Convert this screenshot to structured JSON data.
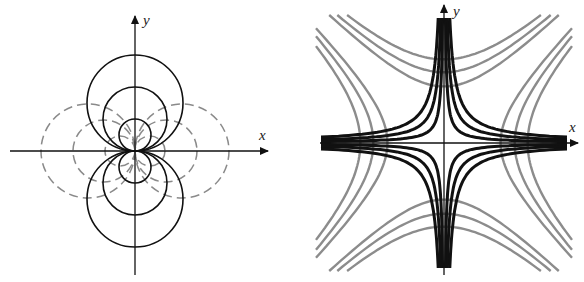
{
  "figure_left": {
    "description": "Dipole field: solid circles tangent to x-axis at origin, dashed circles tangent to y-axis at origin",
    "x_label": "x",
    "y_label": "y",
    "origin": [
      135,
      151
    ],
    "solid_radii": [
      48,
      32,
      16
    ],
    "dashed_radii": [
      47,
      31,
      15
    ],
    "colors": {
      "solid": "#111111",
      "dashed": "#8a8a8a"
    }
  },
  "figure_right": {
    "description": "Quadrupole field: black hyperbolas xy=c and gray hyperbolas x^2-y^2=c",
    "x_label": "x",
    "y_label": "y",
    "origin": [
      444,
      143
    ],
    "black_constants": [
      180,
      420,
      720
    ],
    "gray_constants": [
      3200,
      5000,
      7000
    ],
    "colors": {
      "black": "#111111",
      "gray": "#8c8c8c"
    }
  }
}
